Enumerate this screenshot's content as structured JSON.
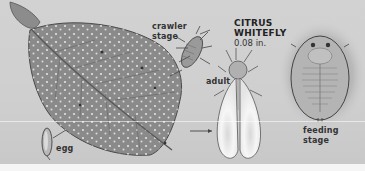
{
  "figure": {
    "title_line1": "CITRUS",
    "title_line2": "WHITEFLY",
    "size": "0.08 in.",
    "labels": {
      "crawler": [
        "crawler",
        "stage"
      ],
      "adult": "adult",
      "egg": "egg",
      "feeding": [
        "feeding",
        "stage"
      ]
    },
    "colors": {
      "background": "#d0d0d0",
      "leaf": "#8a8a8a",
      "leaf_dark": "#5a5a5a",
      "wing": "#f2f2f2",
      "text": "#333333"
    }
  }
}
